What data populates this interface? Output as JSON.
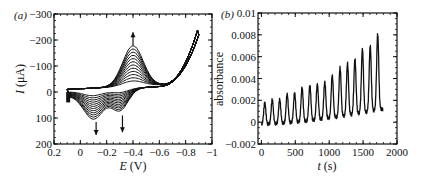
{
  "chart_data": [
    {
      "panel": "(a)",
      "type": "line",
      "title": "",
      "xlabel": "E (V)",
      "ylabel": "I (μA)",
      "xlim": [
        0.2,
        -1.0
      ],
      "ylim": [
        200,
        -300
      ],
      "x_ticks": [
        "0.2",
        "0",
        "−0.2",
        "−0.4",
        "−0.6",
        "−0.8",
        "−1"
      ],
      "x_tick_values": [
        0.2,
        0,
        -0.2,
        -0.4,
        -0.6,
        -0.8,
        -1.0
      ],
      "y_ticks": [
        "−300",
        "−200",
        "−100",
        "0",
        "100",
        "200"
      ],
      "y_tick_values": [
        -300,
        -200,
        -100,
        0,
        100,
        200
      ],
      "grid": false,
      "legend": null,
      "description": "Cyclic voltammograms (repeated scans) with growing anodic peak near -0.4 V and cathodic peaks near -0.1 V and -0.3 V",
      "series_count": 12,
      "anodic_peak": {
        "E": -0.4,
        "I_start": -20,
        "I_end": -155
      },
      "cathodic_peak_1": {
        "E": -0.1,
        "I_start": 20,
        "I_end": 110
      },
      "cathodic_peak_2": {
        "E": -0.3,
        "I_start": 15,
        "I_end": 90
      },
      "switching_point": {
        "E": -0.9,
        "I": -265
      },
      "annotations": [
        {
          "type": "arrow-up",
          "E": -0.4,
          "from_I": -180,
          "to_I": -230
        },
        {
          "type": "arrow-down",
          "E": -0.12,
          "from_I": 115,
          "to_I": 165
        },
        {
          "type": "arrow-down",
          "E": -0.32,
          "from_I": 90,
          "to_I": 155
        }
      ]
    },
    {
      "panel": "(b)",
      "type": "line",
      "title": "",
      "xlabel": "t (s)",
      "ylabel": "absorbance",
      "xlim": [
        -50,
        2000
      ],
      "ylim": [
        -0.002,
        0.01
      ],
      "x_ticks": [
        "0",
        "500",
        "1000",
        "1500",
        "2000"
      ],
      "x_tick_values": [
        0,
        500,
        1000,
        1500,
        2000
      ],
      "y_ticks": [
        "0.01",
        "0.008",
        "0.006",
        "0.004",
        "0.002",
        "0",
        "−0.002"
      ],
      "y_tick_values": [
        0.01,
        0.008,
        0.006,
        0.004,
        0.002,
        0,
        -0.002
      ],
      "grid": false,
      "legend": null,
      "period_s": 111,
      "baseline_start": -0.0002,
      "baseline_end": 0.0012,
      "peaks": [
        {
          "t": 50,
          "value": 0.0018
        },
        {
          "t": 160,
          "value": 0.0021
        },
        {
          "t": 270,
          "value": 0.0021
        },
        {
          "t": 380,
          "value": 0.0026
        },
        {
          "t": 490,
          "value": 0.0027
        },
        {
          "t": 600,
          "value": 0.0032
        },
        {
          "t": 715,
          "value": 0.0034
        },
        {
          "t": 825,
          "value": 0.0035
        },
        {
          "t": 935,
          "value": 0.0037
        },
        {
          "t": 1045,
          "value": 0.0043
        },
        {
          "t": 1160,
          "value": 0.005
        },
        {
          "t": 1270,
          "value": 0.0054
        },
        {
          "t": 1380,
          "value": 0.0058
        },
        {
          "t": 1490,
          "value": 0.0067
        },
        {
          "t": 1605,
          "value": 0.007
        },
        {
          "t": 1715,
          "value": 0.0081
        }
      ],
      "end_point": {
        "t": 1790,
        "value": 0.001
      }
    }
  ]
}
